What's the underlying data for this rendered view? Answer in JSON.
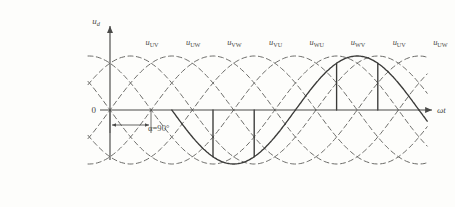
{
  "figure": {
    "type": "waveform-diagram",
    "axes": {
      "y_label": "u",
      "y_sub": "d",
      "x_label": "ωt",
      "origin_label": "0"
    },
    "annotation": {
      "alpha_label": "α=90°"
    },
    "wave_labels": [
      {
        "base": "u",
        "sub": "UV"
      },
      {
        "base": "u",
        "sub": "UW"
      },
      {
        "base": "u",
        "sub": "VW"
      },
      {
        "base": "u",
        "sub": "VU"
      },
      {
        "base": "u",
        "sub": "WU"
      },
      {
        "base": "u",
        "sub": "WV"
      },
      {
        "base": "u",
        "sub": "UV"
      },
      {
        "base": "u",
        "sub": "UW"
      }
    ],
    "colors": {
      "ink": "#4a4a48",
      "solid_wave": "#3a3a38",
      "dashed_wave": "#6b6b68",
      "background": "#fdfdfb"
    }
  },
  "chart_data": {
    "type": "line",
    "title": "",
    "xlabel": "ωt",
    "ylabel": "u_d",
    "firing_angle_deg": 90,
    "pulse_count": 8,
    "dashed_curve_count": 6,
    "legend": [
      "u_UV",
      "u_UW",
      "u_VW",
      "u_VU",
      "u_WU",
      "u_WV"
    ],
    "grid": false
  },
  "scan_artifacts": {
    "left_margin": "   ",
    "bottom_left": "     ",
    "bottom_right": "    ",
    "right_side": "  "
  }
}
